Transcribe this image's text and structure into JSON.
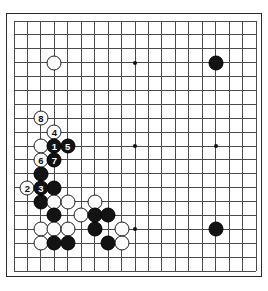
{
  "diagram": {
    "type": "go-board-diagram",
    "board_size": 19,
    "visible_region": {
      "columns": [
        1,
        19
      ],
      "rows": [
        1,
        19
      ]
    },
    "colors": {
      "background": "#ffffff",
      "board_fill": "#ffffff",
      "grid_line": "#4a4a4a",
      "border": "#2b2b2b",
      "black_stone": "#131313",
      "white_stone": "#fbfbfb",
      "black_label_text": "#ffffff",
      "white_label_text": "#101010",
      "hoshi": "#111111"
    },
    "hoshi_points": [
      {
        "col": 4,
        "row": 4
      },
      {
        "col": 10,
        "row": 4
      },
      {
        "col": 16,
        "row": 4
      },
      {
        "col": 4,
        "row": 10
      },
      {
        "col": 10,
        "row": 10
      },
      {
        "col": 16,
        "row": 10
      },
      {
        "col": 4,
        "row": 16
      },
      {
        "col": 10,
        "row": 16
      },
      {
        "col": 16,
        "row": 16
      }
    ],
    "stones": [
      {
        "col": 4,
        "row": 4,
        "color": "white",
        "label": ""
      },
      {
        "col": 16,
        "row": 4,
        "color": "black",
        "label": ""
      },
      {
        "col": 16,
        "row": 16,
        "color": "black",
        "label": ""
      },
      {
        "col": 3,
        "row": 8,
        "color": "white",
        "label": "8"
      },
      {
        "col": 4,
        "row": 9,
        "color": "white",
        "label": "4"
      },
      {
        "col": 3,
        "row": 10,
        "color": "white",
        "label": ""
      },
      {
        "col": 4,
        "row": 10,
        "color": "black",
        "label": "1"
      },
      {
        "col": 5,
        "row": 10,
        "color": "black",
        "label": "5"
      },
      {
        "col": 3,
        "row": 11,
        "color": "white",
        "label": "6"
      },
      {
        "col": 4,
        "row": 11,
        "color": "black",
        "label": "7"
      },
      {
        "col": 3,
        "row": 12,
        "color": "black",
        "label": ""
      },
      {
        "col": 2,
        "row": 13,
        "color": "white",
        "label": "2"
      },
      {
        "col": 3,
        "row": 13,
        "color": "black",
        "label": "3"
      },
      {
        "col": 4,
        "row": 13,
        "color": "black",
        "label": ""
      },
      {
        "col": 3,
        "row": 14,
        "color": "black",
        "label": ""
      },
      {
        "col": 4,
        "row": 14,
        "color": "white",
        "label": ""
      },
      {
        "col": 5,
        "row": 14,
        "color": "white",
        "label": ""
      },
      {
        "col": 7,
        "row": 14,
        "color": "white",
        "label": ""
      },
      {
        "col": 4,
        "row": 15,
        "color": "black",
        "label": ""
      },
      {
        "col": 6,
        "row": 15,
        "color": "white",
        "label": ""
      },
      {
        "col": 7,
        "row": 15,
        "color": "black",
        "label": ""
      },
      {
        "col": 8,
        "row": 15,
        "color": "black",
        "label": ""
      },
      {
        "col": 3,
        "row": 16,
        "color": "white",
        "label": ""
      },
      {
        "col": 4,
        "row": 16,
        "color": "white",
        "label": ""
      },
      {
        "col": 5,
        "row": 16,
        "color": "white",
        "label": ""
      },
      {
        "col": 7,
        "row": 16,
        "color": "black",
        "label": ""
      },
      {
        "col": 9,
        "row": 16,
        "color": "white",
        "label": ""
      },
      {
        "col": 3,
        "row": 17,
        "color": "white",
        "label": ""
      },
      {
        "col": 4,
        "row": 17,
        "color": "black",
        "label": ""
      },
      {
        "col": 5,
        "row": 17,
        "color": "black",
        "label": ""
      },
      {
        "col": 8,
        "row": 17,
        "color": "black",
        "label": ""
      },
      {
        "col": 9,
        "row": 17,
        "color": "white",
        "label": ""
      }
    ],
    "move_labels": [
      "1",
      "2",
      "3",
      "4",
      "5",
      "6",
      "7",
      "8"
    ]
  }
}
